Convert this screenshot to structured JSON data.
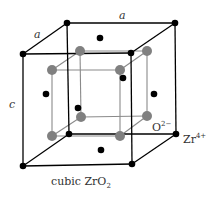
{
  "figure": {
    "caption_main": "cubic ZrO",
    "caption_sub": "2",
    "edge_labels": {
      "top_back": "a",
      "top_left": "a",
      "vertical": "c"
    },
    "ion_labels": {
      "oxygen": {
        "base": "O",
        "sup": "2−"
      },
      "zirconium": {
        "base": "Zr",
        "sup": "4+"
      }
    },
    "colors": {
      "zr_atom": "#000000",
      "o_atom": "#808080",
      "outer_edge": "#000000",
      "inner_edge": "#8a8a8a"
    },
    "outer_cube": {
      "corners": {
        "ftl": [
          23,
          54
        ],
        "ftr": [
          131,
          53
        ],
        "fbl": [
          23,
          166
        ],
        "fbr": [
          132,
          164
        ],
        "btl": [
          67,
          23
        ],
        "btr": [
          175,
          23
        ],
        "bbl": [
          69,
          134
        ],
        "bbr": [
          176,
          134
        ]
      }
    },
    "inner_cube": {
      "corners": {
        "ftl": [
          52,
          70
        ],
        "ftr": [
          120,
          70
        ],
        "fbl": [
          52,
          136
        ],
        "fbr": [
          120,
          136
        ],
        "btl": [
          80,
          51
        ],
        "btr": [
          147,
          51
        ],
        "bbl": [
          81,
          117
        ],
        "bbr": [
          147,
          116
        ]
      }
    },
    "face_centers": [
      [
        100,
        38
      ],
      [
        46,
        94
      ],
      [
        154,
        94
      ],
      [
        123,
        78
      ],
      [
        78,
        108
      ],
      [
        101,
        150
      ]
    ]
  }
}
